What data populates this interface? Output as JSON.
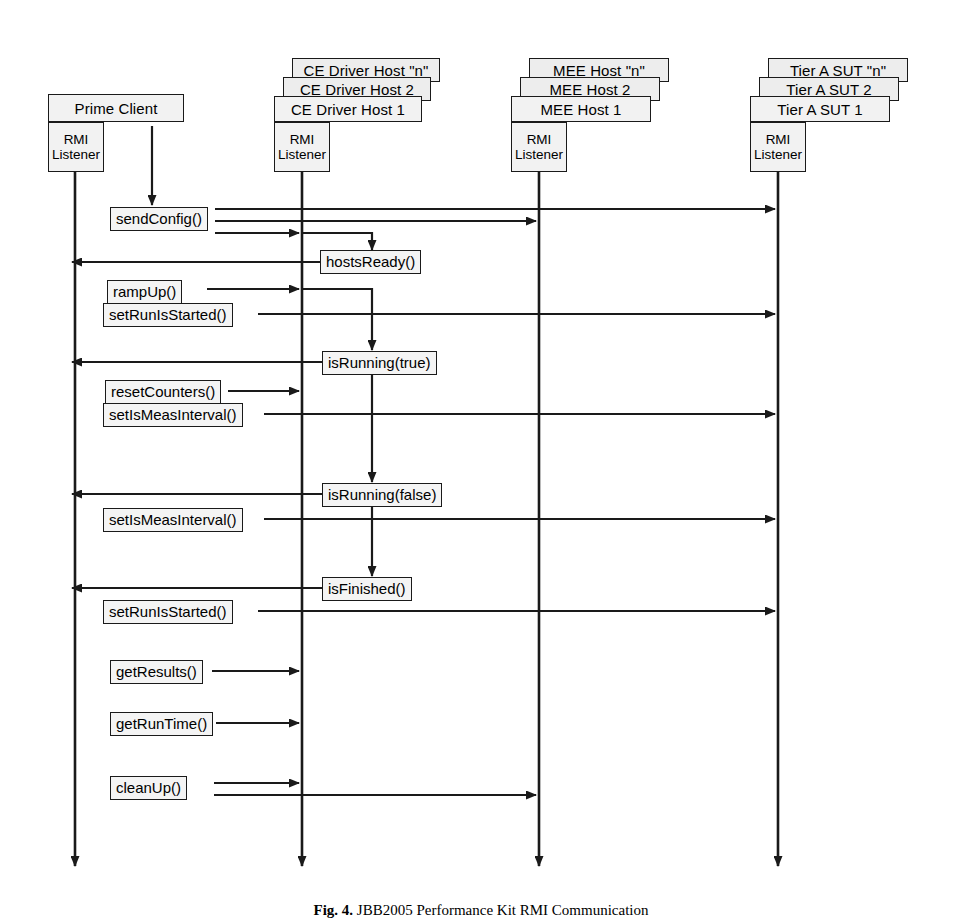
{
  "diagram": {
    "type": "uml-sequence-diagram",
    "caption_prefix": "Fig. 4.",
    "caption_text": "JBB2005 Performance Kit RMI Communication",
    "colors": {
      "line": "#1a1a1a",
      "box_fill": "#f2f2f2",
      "label_fill": "#f4f4f4",
      "background": "#ffffff"
    },
    "lifelines": [
      {
        "id": "prime-client",
        "label": "Prime Client",
        "sub_label_line1": "RMI",
        "sub_label_line2": "Listener",
        "stacked": false,
        "stack_labels": [],
        "x": 75
      },
      {
        "id": "ce-driver-host",
        "label": "CE Driver Host 1",
        "sub_label_line1": "RMI",
        "sub_label_line2": "Listener",
        "stacked": true,
        "stack_labels": [
          "CE Driver Host \"n\"",
          "CE Driver Host 2",
          "CE Driver Host 1"
        ],
        "x": 302
      },
      {
        "id": "mee-host",
        "label": "MEE Host 1",
        "sub_label_line1": "RMI",
        "sub_label_line2": "Listener",
        "stacked": true,
        "stack_labels": [
          "MEE Host \"n\"",
          "MEE Host 2",
          "MEE Host 1"
        ],
        "x": 539
      },
      {
        "id": "tier-a-sut",
        "label": "Tier A SUT 1",
        "sub_label_line1": "RMI",
        "sub_label_line2": "Listener",
        "stacked": true,
        "stack_labels": [
          "Tier A SUT \"n\"",
          "Tier A SUT 2",
          "Tier A SUT 1"
        ],
        "x": 778
      }
    ],
    "messages": [
      {
        "id": "send-config",
        "label": "sendConfig()",
        "from": "prime-client",
        "to": "tier-a-sut",
        "y": 214
      },
      {
        "id": "hosts-ready",
        "label": "hostsReady()",
        "from": "ce-driver-host",
        "to": "prime-client",
        "y": 262
      },
      {
        "id": "ramp-up",
        "label": "rampUp()",
        "from": "prime-client",
        "to": "ce-driver-host",
        "y": 292
      },
      {
        "id": "set-run-is-started",
        "label": "setRunIsStarted()",
        "from": "prime-client",
        "to": "tier-a-sut",
        "y": 314
      },
      {
        "id": "is-running-true",
        "label": "isRunning(true)",
        "from": "ce-driver-host",
        "to": "prime-client",
        "y": 362
      },
      {
        "id": "reset-counters",
        "label": "resetCounters()",
        "from": "prime-client",
        "to": "ce-driver-host",
        "y": 391
      },
      {
        "id": "set-is-meas-1",
        "label": "setIsMeasInterval()",
        "from": "prime-client",
        "to": "tier-a-sut",
        "y": 414
      },
      {
        "id": "is-running-false",
        "label": "isRunning(false)",
        "from": "ce-driver-host",
        "to": "prime-client",
        "y": 494
      },
      {
        "id": "set-is-meas-2",
        "label": "setIsMeasInterval()",
        "from": "prime-client",
        "to": "tier-a-sut",
        "y": 519
      },
      {
        "id": "is-finished",
        "label": "isFinished()",
        "from": "ce-driver-host",
        "to": "prime-client",
        "y": 588
      },
      {
        "id": "set-run-is-started-2",
        "label": "setRunIsStarted()",
        "from": "prime-client",
        "to": "tier-a-sut",
        "y": 611
      },
      {
        "id": "get-results",
        "label": "getResults()",
        "from": "prime-client",
        "to": "ce-driver-host",
        "y": 671
      },
      {
        "id": "get-run-time",
        "label": "getRunTime()",
        "from": "prime-client",
        "to": "ce-driver-host",
        "y": 723
      },
      {
        "id": "clean-up",
        "label": "cleanUp()",
        "from": "prime-client",
        "to": "mee-host",
        "y": 789
      }
    ]
  }
}
